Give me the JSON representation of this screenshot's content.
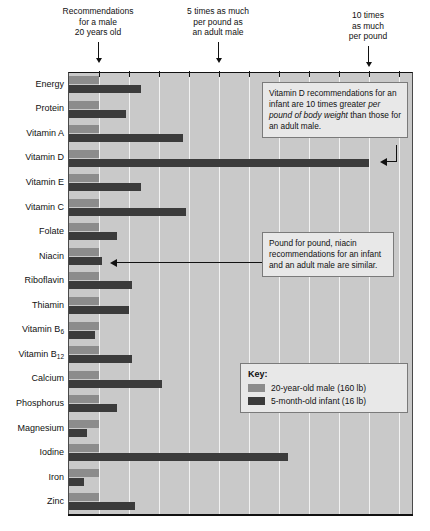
{
  "top_callouts": [
    {
      "text": "Recommendations\nfor a male\n20 years old",
      "value": 1
    },
    {
      "text": "5 times as much\nper pound as\nan adult male",
      "value": 5
    },
    {
      "text": "10 times\nas much\nper pound",
      "value": 10
    }
  ],
  "notes": [
    {
      "id": "vitamin-d-note",
      "pre": "Vitamin D recommendations for an infant are 10 times greater ",
      "italic": "per pound of body weight",
      "post": " than those for an adult male."
    },
    {
      "id": "niacin-note",
      "pre": "Pound for pound, niacin recommendations for an infant and an adult male are similar.",
      "italic": "",
      "post": ""
    }
  ],
  "legend": {
    "title": "Key:",
    "entries": [
      {
        "label": "20-year-old male (160 lb)",
        "color": "#8c8c8c"
      },
      {
        "label": "5-month-old infant (16 lb)",
        "color": "#3b3b3b"
      }
    ]
  },
  "chart_data": {
    "type": "bar",
    "title": "",
    "xlabel": "",
    "ylabel": "",
    "orientation": "horizontal",
    "xlim": [
      0,
      11.5
    ],
    "grid": true,
    "gridlines": [
      1,
      2,
      3,
      4,
      5,
      6,
      7,
      8,
      9,
      10,
      11
    ],
    "categories": [
      "Energy",
      "Protein",
      "Vitamin A",
      "Vitamin D",
      "Vitamin E",
      "Vitamin C",
      "Folate",
      "Niacin",
      "Riboflavin",
      "Thiamin",
      "Vitamin B6",
      "Vitamin B12",
      "Calcium",
      "Phosphorus",
      "Magnesium",
      "Iodine",
      "Iron",
      "Zinc"
    ],
    "series": [
      {
        "name": "20-year-old male (160 lb)",
        "color": "#8c8c8c",
        "values": [
          1,
          1,
          1,
          1,
          1,
          1,
          1,
          1,
          1,
          1,
          1,
          1,
          1,
          1,
          1,
          1,
          1,
          1
        ]
      },
      {
        "name": "5-month-old infant (16 lb)",
        "color": "#3b3b3b",
        "values": [
          2.4,
          1.9,
          3.8,
          10.0,
          2.4,
          3.9,
          1.6,
          1.1,
          2.1,
          2.0,
          0.85,
          2.1,
          3.1,
          1.6,
          0.6,
          7.3,
          0.5,
          2.2
        ]
      }
    ],
    "units": "times as much per pound of body weight compared with an adult male"
  },
  "ylabels": [
    {
      "text": "Energy",
      "sub": ""
    },
    {
      "text": "Protein",
      "sub": ""
    },
    {
      "text": "Vitamin A",
      "sub": ""
    },
    {
      "text": "Vitamin D",
      "sub": ""
    },
    {
      "text": "Vitamin E",
      "sub": ""
    },
    {
      "text": "Vitamin C",
      "sub": ""
    },
    {
      "text": "Folate",
      "sub": ""
    },
    {
      "text": "Niacin",
      "sub": ""
    },
    {
      "text": "Riboflavin",
      "sub": ""
    },
    {
      "text": "Thiamin",
      "sub": ""
    },
    {
      "text": "Vitamin B",
      "sub": "6"
    },
    {
      "text": "Vitamin B",
      "sub": "12"
    },
    {
      "text": "Calcium",
      "sub": ""
    },
    {
      "text": "Phosphorus",
      "sub": ""
    },
    {
      "text": "Magnesium",
      "sub": ""
    },
    {
      "text": "Iodine",
      "sub": ""
    },
    {
      "text": "Iron",
      "sub": ""
    },
    {
      "text": "Zinc",
      "sub": ""
    }
  ],
  "colors": {
    "plot_background": "#c9c9c9",
    "gridline": "#f2f2f2",
    "bar_light": "#8c8c8c",
    "bar_dark": "#3b3b3b",
    "note_background": "#e8e8e8",
    "axis": "#111111"
  }
}
